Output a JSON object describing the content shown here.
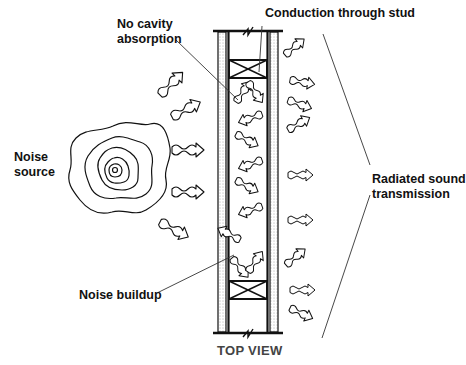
{
  "diagram": {
    "labels": {
      "noise_source_line1": "Noise",
      "noise_source_line2": "source",
      "no_cavity_line1": "No cavity",
      "no_cavity_line2": "absorption",
      "conduction": "Conduction through stud",
      "radiated_line1": "Radiated sound",
      "radiated_line2": "transmission",
      "noise_buildup": "Noise buildup"
    },
    "caption": "TOP VIEW",
    "colors": {
      "stroke": "#111111",
      "caption": "#444444",
      "background": "#ffffff"
    }
  }
}
